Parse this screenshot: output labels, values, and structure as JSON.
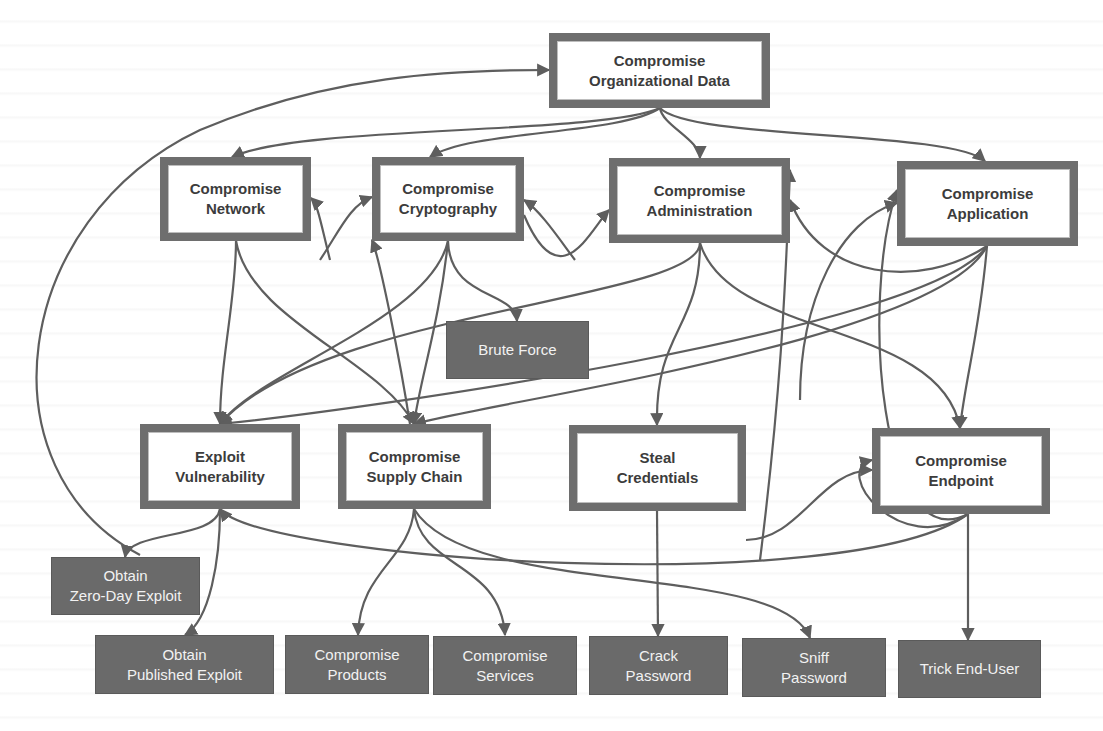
{
  "diagram": {
    "type": "attack-tree",
    "colors": {
      "goal_border": "#6e6e6e",
      "goal_fill": "#ffffff",
      "leaf_fill": "#6a6a6a",
      "edge": "#5e5e5e",
      "goal_text": "#3c3c3c",
      "leaf_text": "#f2f2f2"
    },
    "nodes": {
      "org_data": {
        "label": "Compromise\nOrganizational Data",
        "kind": "goal"
      },
      "network": {
        "label": "Compromise\nNetwork",
        "kind": "goal"
      },
      "cryptography": {
        "label": "Compromise\nCryptography",
        "kind": "goal"
      },
      "administration": {
        "label": "Compromise\nAdministration",
        "kind": "goal"
      },
      "application": {
        "label": "Compromise\nApplication",
        "kind": "goal"
      },
      "brute_force": {
        "label": "Brute Force",
        "kind": "leaf"
      },
      "exploit_vuln": {
        "label": "Exploit\nVulnerability",
        "kind": "goal"
      },
      "supply_chain": {
        "label": "Compromise\nSupply Chain",
        "kind": "goal"
      },
      "steal_creds": {
        "label": "Steal\nCredentials",
        "kind": "goal"
      },
      "endpoint": {
        "label": "Compromise\nEndpoint",
        "kind": "goal"
      },
      "zero_day": {
        "label": "Obtain\nZero-Day Exploit",
        "kind": "leaf"
      },
      "published": {
        "label": "Obtain\nPublished Exploit",
        "kind": "leaf"
      },
      "products": {
        "label": "Compromise\nProducts",
        "kind": "leaf"
      },
      "services": {
        "label": "Compromise\nServices",
        "kind": "leaf"
      },
      "crack_pw": {
        "label": "Crack\nPassword",
        "kind": "leaf"
      },
      "sniff_pw": {
        "label": "Sniff\nPassword",
        "kind": "leaf"
      },
      "trick_user": {
        "label": "Trick End-User",
        "kind": "leaf"
      }
    },
    "edges": [
      [
        "org_data",
        "network"
      ],
      [
        "org_data",
        "cryptography"
      ],
      [
        "org_data",
        "administration"
      ],
      [
        "org_data",
        "application"
      ],
      [
        "exploit_vuln",
        "org_data"
      ],
      [
        "network",
        "exploit_vuln"
      ],
      [
        "network",
        "supply_chain"
      ],
      [
        "network",
        "cryptography"
      ],
      [
        "cryptography",
        "brute_force"
      ],
      [
        "cryptography",
        "exploit_vuln"
      ],
      [
        "cryptography",
        "supply_chain"
      ],
      [
        "cryptography",
        "administration"
      ],
      [
        "cryptography",
        "network"
      ],
      [
        "administration",
        "steal_creds"
      ],
      [
        "administration",
        "endpoint"
      ],
      [
        "administration",
        "exploit_vuln"
      ],
      [
        "administration",
        "cryptography"
      ],
      [
        "administration",
        "application"
      ],
      [
        "application",
        "exploit_vuln"
      ],
      [
        "application",
        "supply_chain"
      ],
      [
        "application",
        "administration"
      ],
      [
        "application",
        "endpoint"
      ],
      [
        "exploit_vuln",
        "zero_day"
      ],
      [
        "exploit_vuln",
        "published"
      ],
      [
        "supply_chain",
        "products"
      ],
      [
        "supply_chain",
        "services"
      ],
      [
        "supply_chain",
        "cryptography"
      ],
      [
        "supply_chain",
        "sniff_pw"
      ],
      [
        "steal_creds",
        "crack_pw"
      ],
      [
        "steal_creds",
        "administration"
      ],
      [
        "steal_creds",
        "endpoint"
      ],
      [
        "endpoint",
        "trick_user"
      ],
      [
        "endpoint",
        "application"
      ],
      [
        "endpoint",
        "exploit_vuln"
      ],
      [
        "endpoint",
        "supply_chain"
      ]
    ]
  }
}
